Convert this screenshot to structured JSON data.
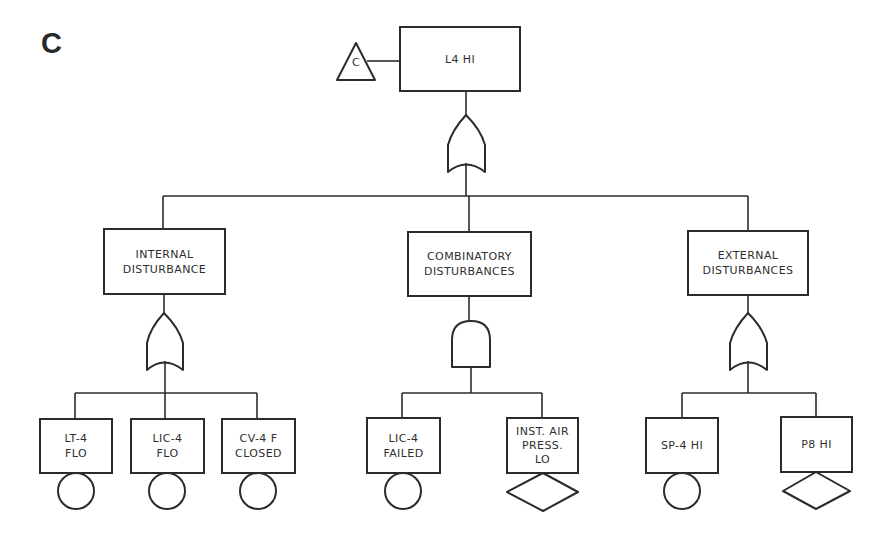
{
  "figure": {
    "panel_label": "C",
    "transfer_symbol": {
      "shape": "triangle",
      "label": "C"
    },
    "top_event": {
      "lines": [
        "L4 HI"
      ],
      "gate": "OR"
    },
    "intermediate_events": [
      {
        "id": "internal",
        "lines": [
          "INTERNAL",
          "DISTURBANCE"
        ],
        "gate": "OR"
      },
      {
        "id": "combinatory",
        "lines": [
          "COMBINATORY",
          "DISTURBANCES"
        ],
        "gate": "AND"
      },
      {
        "id": "external",
        "lines": [
          "EXTERNAL",
          "DISTURBANCES"
        ],
        "gate": "OR"
      }
    ],
    "basic_events": [
      {
        "parent": "internal",
        "lines": [
          "LT-4",
          "FLO"
        ],
        "symbol": "circle"
      },
      {
        "parent": "internal",
        "lines": [
          "LIC-4",
          "FLO"
        ],
        "symbol": "circle"
      },
      {
        "parent": "internal",
        "lines": [
          "CV-4 F",
          "CLOSED"
        ],
        "symbol": "circle"
      },
      {
        "parent": "combinatory",
        "lines": [
          "LIC-4",
          "FAILED"
        ],
        "symbol": "circle"
      },
      {
        "parent": "combinatory",
        "lines": [
          "INST. AIR",
          "PRESS.",
          "LO"
        ],
        "symbol": "diamond"
      },
      {
        "parent": "external",
        "lines": [
          "SP-4 HI"
        ],
        "symbol": "circle"
      },
      {
        "parent": "external",
        "lines": [
          "P8 HI"
        ],
        "symbol": "diamond"
      }
    ],
    "colors": {
      "ink": "#2b2b2b",
      "background": "#ffffff"
    }
  }
}
